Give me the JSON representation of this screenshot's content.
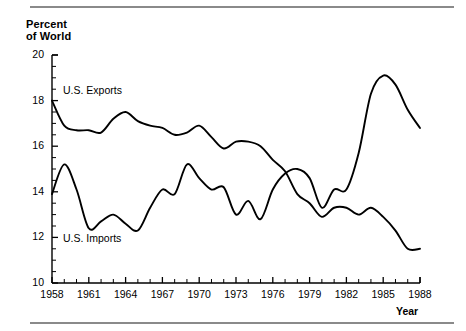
{
  "figure": {
    "yaxis_title": "Percent\nof World",
    "xaxis_title": "Year"
  },
  "chart_data": {
    "type": "line",
    "title": "",
    "subtitle": "",
    "xlabel": "Year",
    "ylabel": "Percent of World",
    "xlim": [
      1958,
      1988
    ],
    "ylim": [
      10,
      20
    ],
    "yticks": [
      10,
      12,
      14,
      16,
      18,
      20
    ],
    "ytick_labels": [
      "10",
      "12",
      "14",
      "16",
      "18",
      "20"
    ],
    "xticks": [
      1958,
      1959,
      1960,
      1961,
      1962,
      1963,
      1964,
      1965,
      1966,
      1967,
      1968,
      1969,
      1970,
      1971,
      1972,
      1973,
      1974,
      1975,
      1976,
      1977,
      1978,
      1979,
      1980,
      1981,
      1982,
      1983,
      1984,
      1985,
      1986,
      1987,
      1988
    ],
    "xtick_labels": [
      "1958",
      "1961",
      "1964",
      "1967",
      "1970",
      "1973",
      "1976",
      "1979",
      "1982",
      "1985",
      "1988"
    ],
    "xtick_labels_shown": [
      1958,
      1961,
      1964,
      1967,
      1970,
      1973,
      1976,
      1979,
      1982,
      1985,
      1988
    ],
    "grid": false,
    "legend": "inline-annotations",
    "x": [
      1958,
      1959,
      1960,
      1961,
      1962,
      1963,
      1964,
      1965,
      1966,
      1967,
      1968,
      1969,
      1970,
      1971,
      1972,
      1973,
      1974,
      1975,
      1976,
      1977,
      1978,
      1979,
      1980,
      1981,
      1982,
      1983,
      1984,
      1985,
      1986,
      1987,
      1988
    ],
    "series": [
      {
        "name": "U.S. Exports",
        "color": "#000000",
        "annotation": "U.S. Exports",
        "values": [
          18.0,
          16.9,
          16.7,
          16.7,
          16.6,
          17.2,
          17.5,
          17.1,
          16.9,
          16.8,
          16.5,
          16.6,
          16.9,
          16.4,
          15.9,
          16.2,
          16.2,
          16.0,
          15.4,
          14.9,
          13.9,
          13.5,
          12.9,
          13.3,
          13.3,
          13.0,
          13.3,
          12.9,
          12.3,
          11.5,
          11.5
        ]
      },
      {
        "name": "U.S. Imports",
        "color": "#000000",
        "annotation": "U.S. Imports",
        "values": [
          13.9,
          15.2,
          14.1,
          12.4,
          12.7,
          13.0,
          12.6,
          12.3,
          13.3,
          14.1,
          13.9,
          15.2,
          14.6,
          14.1,
          14.2,
          13.0,
          13.6,
          12.8,
          14.1,
          14.8,
          15.0,
          14.6,
          13.3,
          14.1,
          14.1,
          15.7,
          18.3,
          19.1,
          18.7,
          17.6,
          16.8
        ]
      }
    ],
    "crossover_region": "1974-1976"
  }
}
